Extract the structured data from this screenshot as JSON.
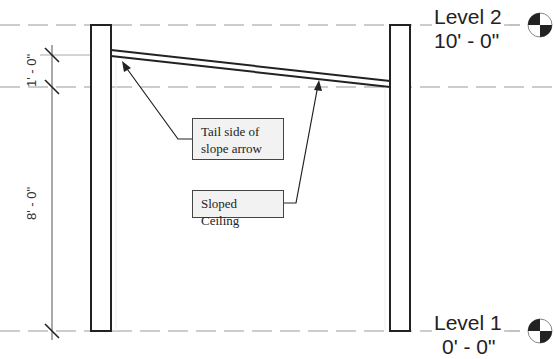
{
  "diagram": {
    "type": "section-view",
    "levels": [
      {
        "name": "Level 2",
        "elevation": "10' - 0\"",
        "y": 25
      },
      {
        "name": "Level 1",
        "elevation": "0' - 0\"",
        "y": 331
      }
    ],
    "dimensions": [
      {
        "label": "1' - 0\"",
        "from": "ceiling-tail",
        "to": "ceiling-reference"
      },
      {
        "label": "8' - 0\"",
        "from": "ceiling-reference",
        "to": "Level 1"
      }
    ],
    "callouts": [
      {
        "id": "tail",
        "text": "Tail side of slope arrow"
      },
      {
        "id": "sloped",
        "text": "Sloped Ceiling"
      }
    ],
    "elements": [
      "left-wall",
      "right-wall",
      "sloped-ceiling"
    ],
    "colors": {
      "line": "#222222",
      "dashed": "#9a9a9a",
      "callout_bg": "#f2f2f2"
    }
  }
}
